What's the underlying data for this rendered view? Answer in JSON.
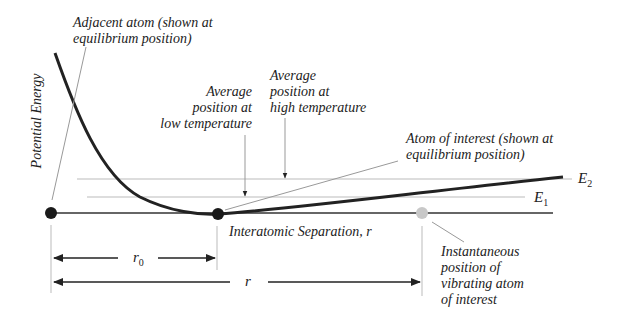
{
  "diagram": {
    "y_axis_label": "Potential Energy",
    "x_axis_label": "Interatomic Separation, r",
    "labels": {
      "adjacent_atom_l1": "Adjacent atom (shown at",
      "adjacent_atom_l2": "equilibrium position)",
      "avg_low_l1": "Average",
      "avg_low_l2": "position at",
      "avg_low_l3": "low temperature",
      "avg_high_l1": "Average",
      "avg_high_l2": "position at",
      "avg_high_l3": "high temperature",
      "atom_interest_l1": "Atom of interest (shown at",
      "atom_interest_l2": "equilibrium position)",
      "instant_l1": "Instantaneous",
      "instant_l2": "position of",
      "instant_l3": "vibrating atom",
      "instant_l4": "of interest",
      "e2": "E",
      "e2_sub": "2",
      "e1": "E",
      "e1_sub": "1",
      "r0": "r",
      "r0_sub": "0",
      "r": "r"
    },
    "colors": {
      "curve": "#222222",
      "leader": "#999999",
      "level": "#bbbbbb",
      "ghost_atom": "#c8c8c8"
    }
  }
}
